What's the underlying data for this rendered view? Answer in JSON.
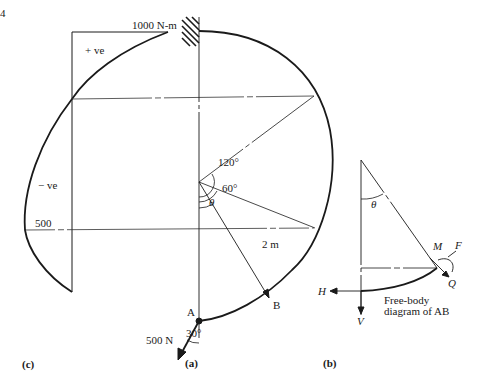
{
  "figure_number": "4",
  "panel_a": {
    "caption": "(a)",
    "radius_label": "2 m",
    "angle_120": "120°",
    "angle_60": "60°",
    "angle_theta": "θ",
    "angle_30": "30°",
    "point_a": "A",
    "point_b": "B",
    "load_label": "500 N"
  },
  "panel_b": {
    "caption": "(b)",
    "angle_theta": "θ",
    "label_m": "M",
    "label_f": "F",
    "label_q": "Q",
    "label_h": "H",
    "label_v": "V",
    "title_line1": "Free-body",
    "title_line2": "diagram of AB"
  },
  "panel_c": {
    "caption": "(c)",
    "max_label": "1000 N-m",
    "positive_label": "+ ve",
    "negative_label": "− ve",
    "mid_label": "500"
  },
  "colors": {
    "ink": "#1a1a1a",
    "background": "#ffffff"
  }
}
